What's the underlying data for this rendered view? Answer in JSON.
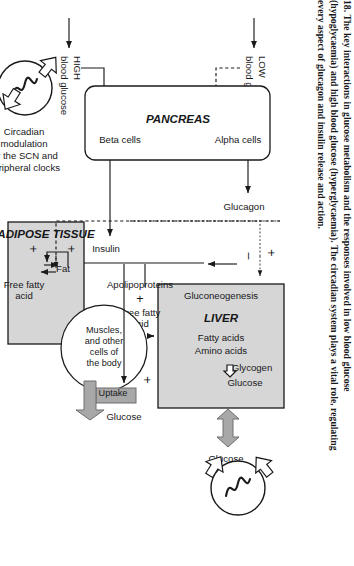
{
  "figure": {
    "number": "18.",
    "caption_lines": [
      "18.  The key interactions in glucose metabolism and the responses involved in low blood glucose",
      "(hypoglycaemia) and high blood glucose (hyperglycaemia). The circadian system plays a vital role, regulating",
      "every aspect of glucagon and insulin release and action."
    ]
  },
  "colors": {
    "box_fill_grey": "#d6d6d6",
    "box_stroke": "#1a1a1a",
    "arrow_grey": "#9a9a9a",
    "text": "#17181a",
    "page_bg": "#ffffff"
  },
  "inputs": {
    "low": {
      "line1": "LOW",
      "line2": "blood glucose"
    },
    "high": {
      "line1": "HIGH",
      "line2": "blood glucose"
    }
  },
  "circadian": {
    "label_lines": [
      "Circadian",
      "modulation",
      "by the SCN and",
      "peripheral clocks"
    ],
    "symbol": "sine-wave"
  },
  "pancreas": {
    "title": "PANCREAS",
    "alpha_cells": "Alpha cells",
    "beta_cells": "Beta cells"
  },
  "hormones": {
    "glucagon": "Glucagon",
    "insulin": "Insulin"
  },
  "liver": {
    "title": "LIVER",
    "gluconeogenesis": "Gluconeogenesis",
    "fatty_acids": "Fatty acids",
    "amino_acids": "Amino acids",
    "glycogen": "Glycogen",
    "glucose": "Glucose",
    "output_glucose": "Glucose",
    "minus_sign": "–",
    "plus_sign": "+"
  },
  "adipose": {
    "title": "ADIPOSE TISSUE",
    "fat": "Fat",
    "free_fatty_acid_line1": "Free fatty",
    "free_fatty_acid_line2": "acid",
    "plus_top": "+",
    "plus_bottom": "+"
  },
  "lipoprotein": {
    "apolipoproteins": "Apolipoproteins",
    "plus": "+",
    "free_fatty_acid_line1": "Free fatty",
    "free_fatty_acid_line2": "acid"
  },
  "muscles": {
    "line1": "Muscles,",
    "line2": "and other",
    "line3": "cells of",
    "line4": "the body"
  },
  "uptake": {
    "label": "Uptake",
    "glucose": "Glucose",
    "plus": "+"
  }
}
